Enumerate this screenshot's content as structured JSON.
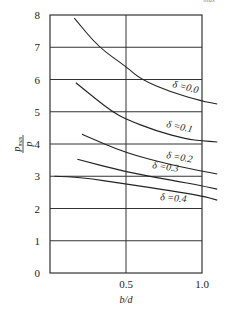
{
  "corner_fragment": "max",
  "chart_data": {
    "type": "line",
    "title": "",
    "xlabel": "b/d",
    "ylabel": "p_max / p",
    "xlim": [
      0,
      1.1
    ],
    "ylim": [
      0,
      8
    ],
    "x_ticks": [
      0.5,
      1.0
    ],
    "x_tick_labels": [
      "0.5",
      "1.0"
    ],
    "y_ticks": [
      0,
      1,
      2,
      3,
      4,
      5,
      6,
      7,
      8
    ],
    "y_tick_labels": [
      "0",
      "1",
      "2",
      "3",
      "4",
      "5",
      "6",
      "7",
      "8"
    ],
    "grid": true,
    "legend_position": "inline labels",
    "series": [
      {
        "name": "δ=0.0",
        "label": "δ =0.0",
        "x": [
          0.16,
          0.32,
          0.5,
          0.6,
          0.8,
          1.0,
          1.1
        ],
        "y": [
          7.9,
          7.0,
          6.4,
          6.0,
          5.6,
          5.33,
          5.24
        ]
      },
      {
        "name": "δ=0.1",
        "label": "δ =0.1",
        "x": [
          0.17,
          0.3,
          0.41,
          0.5,
          0.7,
          0.9,
          1.0,
          1.1
        ],
        "y": [
          5.9,
          5.4,
          5.0,
          4.77,
          4.4,
          4.15,
          4.1,
          4.06
        ]
      },
      {
        "name": "δ=0.2",
        "label": "δ =0.2",
        "x": [
          0.21,
          0.5,
          0.8,
          1.0,
          1.1
        ],
        "y": [
          4.3,
          3.72,
          3.35,
          3.16,
          3.07
        ]
      },
      {
        "name": "δ=0.3",
        "label": "δ =0.3",
        "x": [
          0.18,
          0.5,
          0.8,
          1.0,
          1.1
        ],
        "y": [
          3.53,
          3.13,
          2.88,
          2.7,
          2.6
        ]
      },
      {
        "name": "δ=0.4",
        "label": "δ =0.4",
        "x": [
          0.03,
          0.2,
          0.5,
          0.8,
          1.0,
          1.1
        ],
        "y": [
          3.0,
          2.97,
          2.76,
          2.55,
          2.39,
          2.26
        ]
      }
    ]
  }
}
